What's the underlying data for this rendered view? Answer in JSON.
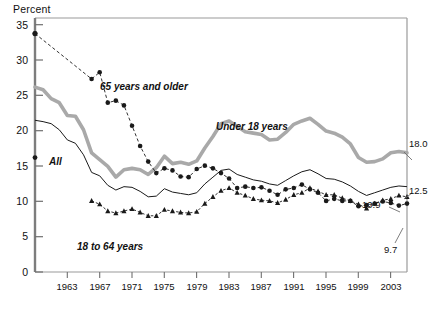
{
  "chart_data": {
    "type": "line",
    "title": "",
    "subtitle": "",
    "ylabel": "Percent",
    "xlabel": "",
    "ylim": [
      0,
      37.5
    ],
    "xlim": [
      1959,
      2005
    ],
    "grid": false,
    "legend_position": "in-plot-annotations",
    "y_ticks": [
      "0",
      "5",
      "10",
      "15",
      "20",
      "25",
      "30",
      "35"
    ],
    "y_tick_values": [
      0,
      5,
      10,
      15,
      20,
      25,
      30,
      35
    ],
    "x_ticks": [
      "1963",
      "1967",
      "1971",
      "1975",
      "1979",
      "1983",
      "1987",
      "1991",
      "1995",
      "1999",
      "2003"
    ],
    "x_tick_values": [
      1963,
      1967,
      1971,
      1975,
      1979,
      1983,
      1987,
      1991,
      1995,
      1999,
      2003
    ],
    "series": [
      {
        "name": "Under 18 years",
        "label": "Under 18 years",
        "style": "thick-gray-line",
        "color": "#a9a9a9",
        "label_x": 1988,
        "label_y": 24.2,
        "end_value": "18.0",
        "x": [
          1959,
          1960,
          1961,
          1962,
          1963,
          1964,
          1965,
          1966,
          1967,
          1968,
          1969,
          1970,
          1971,
          1972,
          1973,
          1974,
          1975,
          1976,
          1977,
          1978,
          1979,
          1980,
          1981,
          1982,
          1983,
          1984,
          1985,
          1986,
          1987,
          1988,
          1989,
          1990,
          1991,
          1992,
          1993,
          1994,
          1995,
          1996,
          1997,
          1998,
          1999,
          2000,
          2001,
          2002,
          2003,
          2004,
          2005
        ],
        "values": [
          27.3,
          26.9,
          25.6,
          25.0,
          23.1,
          23.0,
          21.0,
          17.6,
          16.6,
          15.6,
          14.0,
          15.1,
          15.3,
          15.1,
          14.4,
          15.4,
          17.1,
          16.0,
          16.2,
          15.9,
          16.4,
          18.3,
          20.0,
          21.9,
          22.3,
          21.5,
          20.7,
          20.5,
          20.3,
          19.5,
          19.6,
          20.6,
          21.8,
          22.3,
          22.7,
          21.8,
          20.8,
          20.5,
          19.9,
          18.9,
          16.9,
          16.2,
          16.3,
          16.7,
          17.6,
          17.8,
          17.6
        ]
      },
      {
        "name": "All",
        "label": "All",
        "style": "thin-black-line",
        "color": "#1a1a1a",
        "label_x": 1962,
        "label_y": 18.4,
        "end_value": "12.5",
        "x": [
          1959,
          1960,
          1961,
          1962,
          1963,
          1964,
          1965,
          1966,
          1967,
          1968,
          1969,
          1970,
          1971,
          1972,
          1973,
          1974,
          1975,
          1976,
          1977,
          1978,
          1979,
          1980,
          1981,
          1982,
          1983,
          1984,
          1985,
          1986,
          1987,
          1988,
          1989,
          1990,
          1991,
          1992,
          1993,
          1994,
          1995,
          1996,
          1997,
          1998,
          1999,
          2000,
          2001,
          2002,
          2003,
          2004,
          2005
        ],
        "values": [
          22.4,
          22.2,
          21.9,
          21.0,
          19.5,
          19.0,
          17.3,
          14.7,
          14.2,
          12.8,
          12.1,
          12.6,
          12.5,
          11.9,
          11.1,
          11.2,
          12.3,
          11.8,
          11.6,
          11.4,
          11.7,
          13.0,
          14.0,
          15.0,
          15.2,
          14.4,
          14.0,
          13.6,
          13.4,
          13.0,
          12.8,
          13.5,
          14.2,
          14.8,
          15.1,
          14.5,
          13.8,
          13.7,
          13.3,
          12.7,
          11.9,
          11.3,
          11.7,
          12.1,
          12.5,
          12.7,
          12.6
        ]
      },
      {
        "name": "65 years and older",
        "label": "65 years and older",
        "style": "black-dashed-round-markers",
        "color": "#1a1a1a",
        "label_x": 1968.2,
        "label_y": 28.8,
        "end_value": "9.7",
        "x": [
          1959,
          1966,
          1967,
          1968,
          1969,
          1970,
          1971,
          1972,
          1973,
          1974,
          1975,
          1976,
          1977,
          1978,
          1979,
          1980,
          1981,
          1982,
          1983,
          1984,
          1985,
          1986,
          1987,
          1988,
          1989,
          1990,
          1991,
          1992,
          1993,
          1994,
          1995,
          1996,
          1997,
          1998,
          1999,
          2000,
          2001,
          2002,
          2003,
          2004,
          2005
        ],
        "values": [
          35.2,
          28.5,
          29.5,
          25.0,
          25.3,
          24.6,
          21.6,
          18.6,
          16.3,
          14.6,
          15.3,
          15.0,
          14.1,
          14.0,
          15.2,
          15.7,
          15.3,
          14.6,
          13.8,
          12.4,
          12.6,
          12.4,
          12.5,
          12.0,
          11.4,
          12.2,
          12.4,
          12.9,
          12.2,
          11.7,
          10.5,
          10.8,
          10.5,
          10.5,
          9.7,
          9.9,
          10.1,
          10.4,
          10.2,
          9.8,
          10.1
        ]
      },
      {
        "name": "18 to 64 years",
        "label": "18 to 64 years",
        "style": "black-triangle-markers",
        "color": "#1a1a1a",
        "label_x": 1969.5,
        "label_y": 6.3,
        "end_value": "",
        "x": [
          1966,
          1967,
          1968,
          1969,
          1970,
          1971,
          1972,
          1973,
          1974,
          1975,
          1976,
          1977,
          1978,
          1979,
          1980,
          1981,
          1982,
          1983,
          1984,
          1985,
          1986,
          1987,
          1988,
          1989,
          1990,
          1991,
          1992,
          1993,
          1994,
          1995,
          1996,
          1997,
          1998,
          1999,
          2000,
          2001,
          2002,
          2003,
          2004,
          2005
        ],
        "values": [
          10.5,
          10.0,
          9.0,
          8.7,
          9.0,
          9.3,
          8.8,
          8.3,
          8.3,
          9.2,
          9.0,
          8.8,
          8.7,
          8.9,
          10.1,
          11.1,
          12.0,
          12.4,
          11.7,
          11.3,
          10.8,
          10.6,
          10.5,
          10.2,
          10.7,
          11.4,
          11.7,
          12.4,
          11.9,
          11.4,
          11.4,
          10.9,
          10.5,
          10.0,
          9.4,
          10.1,
          10.6,
          10.8,
          11.3,
          11.1
        ]
      }
    ],
    "end_labels": [
      {
        "text": "18.0",
        "series": "Under 18 years",
        "value": 18.0
      },
      {
        "text": "12.5",
        "series": "All",
        "value": 12.5
      },
      {
        "text": "10.9",
        "series": "18 to 64 years",
        "value": 10.9
      },
      {
        "text": "9.7",
        "series": "65 years and older",
        "value": 9.7
      }
    ],
    "annotations": [
      {
        "text": "Under 18 years",
        "type": "series-label"
      },
      {
        "text": "All",
        "type": "series-label"
      },
      {
        "text": "65 years and older",
        "type": "series-label"
      },
      {
        "text": "18 to 64 years",
        "type": "series-label"
      }
    ],
    "colors": {
      "under18": "#a9a9a9",
      "all": "#1a1a1a",
      "age65plus": "#1a1a1a",
      "age18to64": "#1a1a1a",
      "axis": "#808080",
      "frame": "#9a9a9a",
      "text": "#111111"
    }
  }
}
